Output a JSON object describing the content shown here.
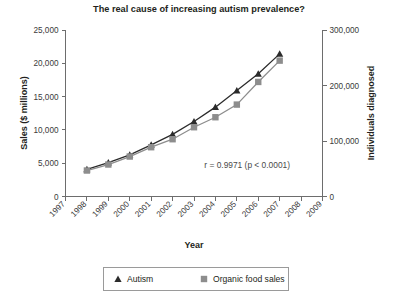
{
  "chart_data": {
    "type": "line",
    "title": "The real cause of increasing autism prevalence?",
    "xlabel": "Year",
    "ylabel": "Sales ($ millions)",
    "y2label": "Individuals diagnosed",
    "x": [
      1998,
      1999,
      2000,
      2001,
      2002,
      2003,
      2004,
      2005,
      2006,
      2007
    ],
    "xlim": [
      1997,
      2009
    ],
    "xticks": [
      1997,
      1998,
      1999,
      2000,
      2001,
      2002,
      2003,
      2004,
      2005,
      2006,
      2007,
      2008,
      2009
    ],
    "xticklabels": [
      "1997",
      "1998",
      "1999",
      "2000",
      "2001",
      "2002",
      "2003",
      "2004",
      "2005",
      "2006",
      "2007",
      "2008",
      "2009"
    ],
    "ylim": [
      0,
      25000
    ],
    "yticks": [
      0,
      5000,
      10000,
      15000,
      20000,
      25000
    ],
    "yticklabels": [
      "0",
      "5,000",
      "10,000",
      "15,000",
      "20,000",
      "25,000"
    ],
    "y2lim": [
      0,
      300000
    ],
    "y2ticks": [
      0,
      100000,
      200000,
      300000
    ],
    "y2ticklabels": [
      "0",
      "100,000",
      "200,000",
      "300,000"
    ],
    "grid": false,
    "legend_position": "bottom",
    "annotation": "r = 0.9971 (p < 0.0001)",
    "series": [
      {
        "name": "Autism",
        "marker": "triangle",
        "axis": "right",
        "color": "#2b2b2b",
        "values": [
          49000,
          61000,
          75000,
          93000,
          112000,
          135000,
          161000,
          191000,
          221000,
          257000
        ]
      },
      {
        "name": "Organic food sales",
        "marker": "square",
        "axis": "left",
        "color": "#8d8d8d",
        "values": [
          3900,
          4800,
          6000,
          7400,
          8600,
          10400,
          11900,
          13800,
          17200,
          20400
        ]
      }
    ]
  },
  "legend": {
    "items": [
      {
        "label": "Autism",
        "marker": "triangle",
        "color": "#2b2b2b"
      },
      {
        "label": "Organic food sales",
        "marker": "square",
        "color": "#8d8d8d"
      }
    ]
  }
}
